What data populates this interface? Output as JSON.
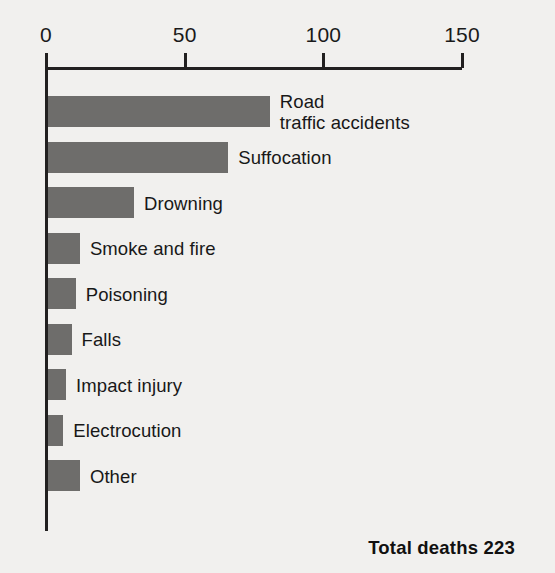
{
  "chart_data": {
    "type": "bar",
    "orientation": "horizontal",
    "title": "",
    "xlabel": "",
    "ylabel": "",
    "xlim": [
      0,
      150
    ],
    "ticks": [
      0,
      50,
      100,
      150
    ],
    "tick_labels": [
      "0",
      "50",
      "100",
      "150"
    ],
    "grid": false,
    "legend": null,
    "bar_color": "#6e6d6b",
    "background_color": "#f1f0ee",
    "axis_color": "#222020",
    "categories": [
      "Road\ntraffic accidents",
      "Suffocation",
      "Drowning",
      "Smoke and fire",
      "Poisoning",
      "Falls",
      "Impact injury",
      "Electrocution",
      "Other"
    ],
    "values": [
      80,
      65,
      31,
      11.5,
      10,
      8.5,
      6.5,
      5.5,
      11.5
    ],
    "annotations": [
      "Total deaths 223"
    ]
  },
  "axis": {
    "ticks": [
      {
        "label": "0",
        "value": 0
      },
      {
        "label": "50",
        "value": 50
      },
      {
        "label": "100",
        "value": 100
      },
      {
        "label": "150",
        "value": 150
      }
    ]
  },
  "bars": [
    {
      "label": "Road\ntraffic accidents",
      "value": 80
    },
    {
      "label": "Suffocation",
      "value": 65
    },
    {
      "label": "Drowning",
      "value": 31
    },
    {
      "label": "Smoke and fire",
      "value": 11.5
    },
    {
      "label": "Poisoning",
      "value": 10
    },
    {
      "label": "Falls",
      "value": 8.5
    },
    {
      "label": "Impact injury",
      "value": 6.5
    },
    {
      "label": "Electrocution",
      "value": 5.5
    },
    {
      "label": "Other",
      "value": 11.5
    }
  ],
  "footer": {
    "total_label": "Total deaths 223"
  }
}
